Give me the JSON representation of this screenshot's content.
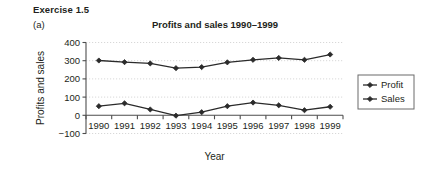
{
  "header": {
    "exercise_label": "Exercise 1.5",
    "part_label": "(a)"
  },
  "chart_data": {
    "type": "line",
    "title": "Profits and sales 1990–1999",
    "xlabel": "Year",
    "ylabel": "Profits and sales",
    "categories": [
      "1990",
      "1991",
      "1992",
      "1993",
      "1994",
      "1995",
      "1996",
      "1997",
      "1998",
      "1999"
    ],
    "series": [
      {
        "name": "Profit",
        "marker": "diamond",
        "color": "#2b2b2b",
        "values": [
          50,
          66,
          32,
          -2,
          17,
          50,
          70,
          55,
          28,
          47
        ]
      },
      {
        "name": "Sales",
        "marker": "diamond",
        "color": "#2b2b2b",
        "values": [
          301,
          292,
          285,
          259,
          265,
          291,
          305,
          315,
          305,
          334
        ]
      }
    ],
    "ylim": [
      -100,
      400
    ],
    "yticks": [
      400,
      300,
      200,
      100,
      0,
      -100
    ],
    "ytick_labels": [
      "400",
      "300",
      "200",
      "100",
      "0",
      "−100"
    ],
    "grid": true,
    "grid_style": "dotted",
    "grid_color": "#d8d8d8",
    "legend_position": "right",
    "legend_entries": [
      "Profit",
      "Sales"
    ],
    "axis_color": "#4d4d4d"
  }
}
